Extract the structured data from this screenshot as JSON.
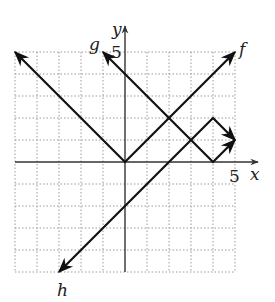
{
  "figure": {
    "type": "coordinate-graph",
    "axes": {
      "x_label": "x",
      "y_label": "y",
      "x_tick_label": "5",
      "y_tick_label": "5",
      "x_range": [
        -5,
        5
      ],
      "y_range": [
        -5,
        5
      ],
      "grid": true,
      "grid_style": "dotted"
    },
    "curves": [
      {
        "name": "f",
        "label": "f",
        "description": "y = |x|",
        "points": [
          [
            -5,
            5
          ],
          [
            0,
            0
          ],
          [
            5,
            5
          ]
        ]
      },
      {
        "name": "g",
        "label": "g",
        "description": "y = |x - 4|",
        "points": [
          [
            -1,
            5
          ],
          [
            4,
            0
          ],
          [
            5,
            1
          ]
        ]
      },
      {
        "name": "h",
        "label": "h",
        "description": "y = -|x - 4| + 2",
        "points": [
          [
            -3,
            -5
          ],
          [
            4,
            2
          ],
          [
            5,
            1
          ]
        ]
      }
    ],
    "colors": {
      "line": "#111111",
      "grid": "#9a9a9a",
      "axis": "#333333"
    }
  }
}
